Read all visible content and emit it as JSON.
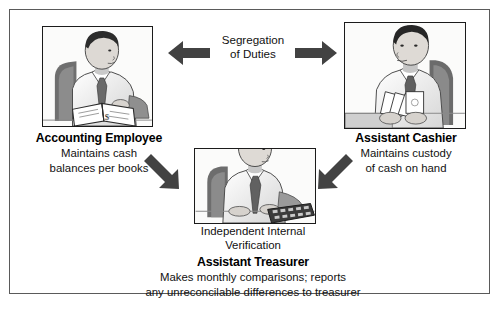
{
  "diagram": {
    "title_label": "Segregation of Duties",
    "segregation": {
      "line1": "Segregation",
      "line2": "of Duties"
    },
    "nodes": [
      {
        "id": "accounting-employee",
        "role": "Accounting Employee",
        "duty_line1": "Maintains cash",
        "duty_line2": "balances per books",
        "illustration": "person-reading-ledger-icon"
      },
      {
        "id": "assistant-cashier",
        "role": "Assistant Cashier",
        "duty_line1": "Maintains custody",
        "duty_line2": "of cash on hand",
        "illustration": "person-holding-cash-icon"
      },
      {
        "id": "assistant-treasurer",
        "role": "Assistant Treasurer",
        "verification_line1": "Independent Internal",
        "verification_line2": "Verification",
        "duty_line1": "Makes monthly comparisons; reports",
        "duty_line2": "any unreconcilable differences to treasurer",
        "illustration": "person-using-calculator-icon"
      }
    ],
    "arrows": [
      {
        "id": "arrow-left",
        "direction": "left",
        "name": "arrow-left-icon"
      },
      {
        "id": "arrow-right",
        "direction": "right",
        "name": "arrow-right-icon"
      },
      {
        "id": "arrow-down-left",
        "direction": "down-right",
        "name": "arrow-down-right-icon"
      },
      {
        "id": "arrow-down-right",
        "direction": "down-left",
        "name": "arrow-down-left-icon"
      }
    ],
    "colors": {
      "frame": "#5a5a5a",
      "box_border": "#1b1b1b",
      "arrow_fill": "#404040",
      "text": "#111111",
      "background": "#ffffff"
    }
  }
}
